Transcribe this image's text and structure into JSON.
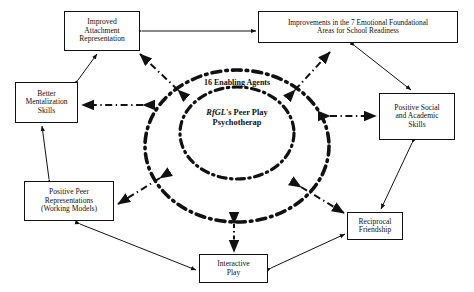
{
  "diagram": {
    "core": {
      "outer_ellipse_label": "16 Enabling Agents",
      "inner_lines": [
        "RfGL",
        "'s",
        "Peer Play",
        "Psychotherap"
      ],
      "inner_line1_italic": "RfGL",
      "inner_line1_suffix": "'s",
      "inner_line2": "Peer Play",
      "inner_line3": "Psychotherap"
    },
    "nodes": [
      {
        "id": "improved-attachment",
        "lines": [
          "Improved",
          "Attachment",
          "Representation"
        ]
      },
      {
        "id": "improvements-7",
        "lines": [
          "Improvements in the 7 Emotional Foundational",
          "Areas for School Readiness"
        ]
      },
      {
        "id": "better-mentalization",
        "lines": [
          "Better",
          "Mentalization",
          "Skills"
        ]
      },
      {
        "id": "positive-social",
        "lines": [
          "Positive Social",
          "and Academic",
          "Skills"
        ]
      },
      {
        "id": "positive-peer",
        "lines": [
          "Positive Peer",
          "Representations",
          "(Working Models)"
        ]
      },
      {
        "id": "reciprocal-friendship",
        "lines": [
          "Reciprocal",
          "Friendship"
        ]
      },
      {
        "id": "interactive-play",
        "lines": [
          "Interactive",
          "Play"
        ]
      }
    ],
    "edges": [
      {
        "from": "improved-attachment",
        "to": "improvements-7",
        "style": "solid",
        "arrows": "both"
      },
      {
        "from": "improved-attachment",
        "to": "better-mentalization",
        "style": "solid",
        "arrows": "both"
      },
      {
        "from": "better-mentalization",
        "to": "positive-peer",
        "style": "solid",
        "arrows": "both"
      },
      {
        "from": "improvements-7",
        "to": "positive-social",
        "style": "solid",
        "arrows": "both"
      },
      {
        "from": "positive-social",
        "to": "reciprocal-friendship",
        "style": "solid",
        "arrows": "both"
      },
      {
        "from": "positive-peer",
        "to": "interactive-play",
        "style": "solid",
        "arrows": "both"
      },
      {
        "from": "interactive-play",
        "to": "reciprocal-friendship",
        "style": "solid",
        "arrows": "both"
      },
      {
        "from": "core",
        "to": "improved-attachment",
        "style": "dash-dot",
        "arrows": "both"
      },
      {
        "from": "core",
        "to": "improvements-7",
        "style": "dash-dot",
        "arrows": "both"
      },
      {
        "from": "core",
        "to": "better-mentalization",
        "style": "dash-dot",
        "arrows": "both"
      },
      {
        "from": "core",
        "to": "positive-social",
        "style": "dash-dot",
        "arrows": "both"
      },
      {
        "from": "core",
        "to": "positive-peer",
        "style": "dash-dot",
        "arrows": "both"
      },
      {
        "from": "core",
        "to": "reciprocal-friendship",
        "style": "dash-dot",
        "arrows": "both"
      },
      {
        "from": "core",
        "to": "interactive-play",
        "style": "dash-dot",
        "arrows": "both"
      }
    ],
    "colors": {
      "ink": "#111111",
      "background": "#ffffff",
      "box_border": "#111111"
    }
  }
}
